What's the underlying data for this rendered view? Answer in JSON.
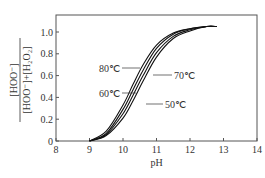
{
  "chart_data": {
    "type": "line",
    "title": "",
    "xlabel": "pH",
    "ylabel": "[HOO⁻] / ([HOO⁻]+[H₂O₂])",
    "ylabel_numerator": "[HOO⁻]",
    "ylabel_denominator": "[HOO⁻]+[H₂O₂]",
    "xlim": [
      8,
      14
    ],
    "ylim": [
      0,
      1.1
    ],
    "x_ticks": [
      "8",
      "9",
      "10",
      "11",
      "12",
      "13",
      "14"
    ],
    "y_ticks": [
      "0",
      "0.2",
      "0.4",
      "0.6",
      "0.8",
      "1.0"
    ],
    "grid": false,
    "legend": "inline labels",
    "series": [
      {
        "name": "80℃",
        "x": [
          9.0,
          9.5,
          10.0,
          10.3,
          10.6,
          11.0,
          11.5,
          12.0,
          12.5,
          12.8
        ],
        "y": [
          0.0,
          0.09,
          0.33,
          0.52,
          0.7,
          0.88,
          0.99,
          1.03,
          1.05,
          1.05
        ]
      },
      {
        "name": "70℃",
        "x": [
          9.0,
          9.5,
          10.0,
          10.3,
          10.6,
          11.0,
          11.5,
          12.0,
          12.5,
          12.8
        ],
        "y": [
          0.0,
          0.07,
          0.29,
          0.47,
          0.65,
          0.85,
          0.98,
          1.03,
          1.05,
          1.05
        ]
      },
      {
        "name": "60℃",
        "x": [
          9.0,
          9.5,
          10.0,
          10.3,
          10.6,
          11.0,
          11.5,
          12.0,
          12.5,
          12.8
        ],
        "y": [
          0.0,
          0.06,
          0.25,
          0.42,
          0.6,
          0.81,
          0.96,
          1.02,
          1.05,
          1.05
        ]
      },
      {
        "name": "50℃",
        "x": [
          9.0,
          9.5,
          10.0,
          10.3,
          10.6,
          11.0,
          11.5,
          12.0,
          12.5,
          12.8
        ],
        "y": [
          0.0,
          0.05,
          0.21,
          0.37,
          0.55,
          0.77,
          0.94,
          1.01,
          1.05,
          1.05
        ]
      }
    ],
    "annotations": [
      {
        "text": "80℃",
        "x": 10.0,
        "y": 0.72
      },
      {
        "text": "70℃",
        "x": 11.4,
        "y": 0.62
      },
      {
        "text": "60℃",
        "x": 9.75,
        "y": 0.46
      },
      {
        "text": "50℃",
        "x": 11.1,
        "y": 0.37
      }
    ]
  }
}
